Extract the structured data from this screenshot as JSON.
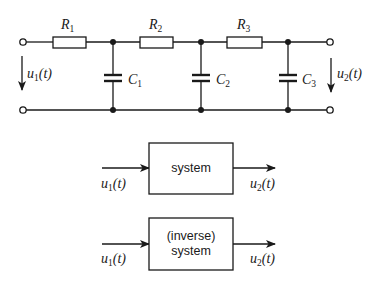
{
  "circuit": {
    "resistors": [
      {
        "name": "R",
        "sub": "1"
      },
      {
        "name": "R",
        "sub": "2"
      },
      {
        "name": "R",
        "sub": "3"
      }
    ],
    "capacitors": [
      {
        "name": "C",
        "sub": "1"
      },
      {
        "name": "C",
        "sub": "2"
      },
      {
        "name": "C",
        "sub": "3"
      }
    ],
    "input_voltage": {
      "name": "u",
      "sub": "1",
      "arg": "(t)"
    },
    "output_voltage": {
      "name": "u",
      "sub": "2",
      "arg": "(t)"
    }
  },
  "block_diagrams": [
    {
      "box_lines": [
        "system"
      ],
      "input": {
        "name": "u",
        "sub": "1",
        "arg": "(t)"
      },
      "output": {
        "name": "u",
        "sub": "2",
        "arg": "(t)"
      }
    },
    {
      "box_lines": [
        "(inverse)",
        "system"
      ],
      "input": {
        "name": "u",
        "sub": "1",
        "arg": "(t)"
      },
      "output": {
        "name": "u",
        "sub": "2",
        "arg": "(t)"
      }
    }
  ],
  "colors": {
    "ink": "#1a1a1a",
    "background": "#ffffff"
  }
}
